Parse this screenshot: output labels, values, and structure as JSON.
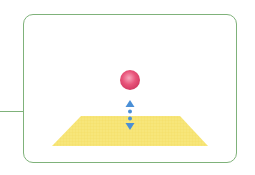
{
  "diagram": {
    "frame": {
      "border_color": "#7fb27a",
      "background": "#ffffff"
    },
    "ball": {
      "color": "#e8547a",
      "highlight": "#f7a8bd",
      "cx": 130,
      "cy": 80,
      "r": 10
    },
    "arrow": {
      "color": "#4a8fd6",
      "direction": "vertical-both"
    },
    "plane": {
      "color": "#f7e67a",
      "top": [
        [
          81,
          116
        ],
        [
          180,
          116
        ]
      ],
      "bottom": [
        [
          52,
          146
        ],
        [
          208,
          146
        ]
      ]
    },
    "leader_line": {
      "color": "#7fb27a"
    }
  }
}
